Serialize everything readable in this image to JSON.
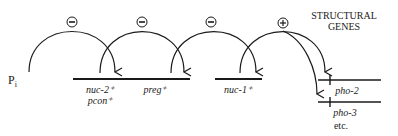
{
  "diagram": {
    "input_label": "P",
    "input_subscript": "i",
    "header": [
      "STRUCTURAL",
      "GENES"
    ],
    "regulators": [
      {
        "label_lines": [
          "nuc-2⁺",
          "pcon⁺"
        ],
        "effect": "negative",
        "effect_symbol": "⊖"
      },
      {
        "label_lines": [
          "preg⁺"
        ],
        "effect": "negative",
        "effect_symbol": "⊖"
      },
      {
        "label_lines": [
          "nuc-1⁺"
        ],
        "effect": "negative",
        "effect_symbol": "⊖"
      }
    ],
    "activator_effect": {
      "effect": "positive",
      "effect_symbol": "⊕"
    },
    "structural_genes": [
      "pho-2",
      "pho-3"
    ],
    "more_label": "etc.",
    "colors": {
      "ink": "#1a1a1a",
      "background": "#ffffff"
    }
  }
}
